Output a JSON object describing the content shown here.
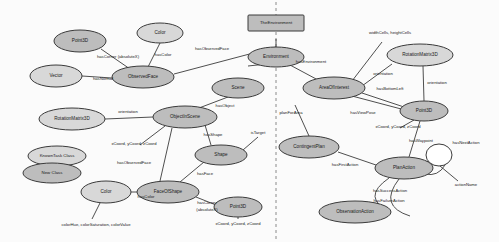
{
  "diagram": {
    "colors": {
      "node_shaded": "#bdbdbd",
      "node_light": "#d8d8d8",
      "node_blank": "#ffffff",
      "stroke": "#3b3b3b",
      "divider": "#8a8a8a",
      "background": "#fbfbfb"
    },
    "instance_nodes": [
      {
        "id": "the-environment",
        "label": "TheEnvironment",
        "shape": "rectangle",
        "x": 276,
        "y": 23,
        "w": 56,
        "h": 16
      }
    ],
    "class_nodes": [
      {
        "id": "point3d-left",
        "label": "Point3D",
        "x": 80,
        "y": 41,
        "rx": 26,
        "ry": 11,
        "fill": "shaded"
      },
      {
        "id": "color-top",
        "label": "Color",
        "x": 160,
        "y": 33,
        "rx": 23,
        "ry": 10,
        "fill": "light"
      },
      {
        "id": "vector",
        "label": "Vector",
        "x": 56,
        "y": 76,
        "rx": 26,
        "ry": 11,
        "fill": "light"
      },
      {
        "id": "observed-face",
        "label": "ObservedFace",
        "x": 143,
        "y": 77,
        "rx": 31,
        "ry": 11,
        "fill": "shaded"
      },
      {
        "id": "environment",
        "label": "Environment",
        "x": 276,
        "y": 57,
        "rx": 28,
        "ry": 10,
        "fill": "shaded"
      },
      {
        "id": "area-of-interest",
        "label": "AreaOfInterest",
        "x": 334,
        "y": 88,
        "rx": 31,
        "ry": 11,
        "fill": "shaded"
      },
      {
        "id": "rotation-matrix-r",
        "label": "RotationMatrix3D",
        "x": 420,
        "y": 55,
        "rx": 33,
        "ry": 11,
        "fill": "light"
      },
      {
        "id": "point3d-right",
        "label": "Point3D",
        "x": 424,
        "y": 111,
        "rx": 24,
        "ry": 10,
        "fill": "shaded"
      },
      {
        "id": "scene",
        "label": "Scene",
        "x": 238,
        "y": 88,
        "rx": 26,
        "ry": 10,
        "fill": "shaded"
      },
      {
        "id": "rotation-matrix-l",
        "label": "RotationMatrix3D",
        "x": 72,
        "y": 119,
        "rx": 33,
        "ry": 11,
        "fill": "light"
      },
      {
        "id": "object-in-scene",
        "label": "ObjectInScene",
        "x": 185,
        "y": 117,
        "rx": 32,
        "ry": 11,
        "fill": "shaded"
      },
      {
        "id": "shape",
        "label": "Shape",
        "x": 221,
        "y": 155,
        "rx": 26,
        "ry": 10,
        "fill": "shaded"
      },
      {
        "id": "face-of-shape",
        "label": "FaceOfShape",
        "x": 168,
        "y": 192,
        "rx": 31,
        "ry": 11,
        "fill": "shaded"
      },
      {
        "id": "color-bottom",
        "label": "Color",
        "x": 106,
        "y": 192,
        "rx": 25,
        "ry": 11,
        "fill": "light"
      },
      {
        "id": "point3d-bottom",
        "label": "Point3D",
        "x": 238,
        "y": 207,
        "rx": 24,
        "ry": 10,
        "fill": "shaded"
      },
      {
        "id": "contingent-plan",
        "label": "ContingentPlan",
        "x": 309,
        "y": 147,
        "rx": 30,
        "ry": 11,
        "fill": "shaded"
      },
      {
        "id": "plan-action",
        "label": "PlanAction",
        "x": 404,
        "y": 168,
        "rx": 29,
        "ry": 11,
        "fill": "shaded"
      },
      {
        "id": "observation-action",
        "label": "ObservationAction",
        "x": 355,
        "y": 212,
        "rx": 36,
        "ry": 11,
        "fill": "shaded"
      },
      {
        "id": "action-name-value",
        "label": "",
        "x": 439,
        "y": 155,
        "rx": 13,
        "ry": 11,
        "fill": "blank"
      }
    ],
    "legend": [
      {
        "id": "legend-known",
        "label": "KnownTask Class",
        "x": 57,
        "y": 156,
        "rx": 29,
        "ry": 10,
        "fill": "light"
      },
      {
        "id": "legend-new",
        "label": "New Class",
        "x": 52,
        "y": 173,
        "rx": 29,
        "ry": 10,
        "fill": "shaded"
      }
    ],
    "edge_labels": [
      {
        "id": "has-corner-left",
        "text": "hasCorner (absoluteX)",
        "x": 118,
        "y": 57
      },
      {
        "id": "has-color-top",
        "text": "hasColor",
        "x": 163,
        "y": 55
      },
      {
        "id": "has-normal",
        "text": "hasNormal",
        "x": 103,
        "y": 79
      },
      {
        "id": "has-observed-face-top",
        "text": "hasObservedFace",
        "x": 212,
        "y": 49
      },
      {
        "id": "has-environment",
        "text": "hasEnvironment",
        "x": 311,
        "y": 62
      },
      {
        "id": "width-height-cells",
        "text": "widthCells, heightCells",
        "x": 390,
        "y": 33
      },
      {
        "id": "orientation-right",
        "text": "orientation",
        "x": 383,
        "y": 74
      },
      {
        "id": "has-bottom-left",
        "text": "hasBottomLeft",
        "x": 390,
        "y": 89
      },
      {
        "id": "orientation-vert",
        "text": "orientation",
        "x": 433,
        "y": 83
      },
      {
        "id": "x-y-z-coord-right",
        "text": "xCoord, yCoord, zCoord",
        "x": 398,
        "y": 127
      },
      {
        "id": "has-view-pose",
        "text": "hasViewPose",
        "x": 365,
        "y": 113
      },
      {
        "id": "has-waypoint",
        "text": "hasWaypoint",
        "x": 421,
        "y": 141
      },
      {
        "id": "has-next-action",
        "text": "hasNextAction",
        "x": 466,
        "y": 143
      },
      {
        "id": "action-name",
        "text": "actionName",
        "x": 463,
        "y": 185
      },
      {
        "id": "plan-for-area",
        "text": "planForArea",
        "x": 283,
        "y": 113
      },
      {
        "id": "has-first-action",
        "text": "hasFirstAction",
        "x": 345,
        "y": 165
      },
      {
        "id": "has-success-action",
        "text": "hasSuccessAction",
        "x": 390,
        "y": 191
      },
      {
        "id": "has-failure-action",
        "text": "hasFailureAction",
        "x": 389,
        "y": 201
      },
      {
        "id": "has-object",
        "text": "hasObject",
        "x": 225,
        "y": 106
      },
      {
        "id": "orientation-left",
        "text": "orientation",
        "x": 128,
        "y": 112
      },
      {
        "id": "x-y-z-coord-left",
        "text": "xCoord, yCoord, zCoord",
        "x": 134,
        "y": 144
      },
      {
        "id": "has-shape",
        "text": "hasShape",
        "x": 213,
        "y": 135
      },
      {
        "id": "is-target",
        "text": "isTarget",
        "x": 256,
        "y": 133
      },
      {
        "id": "has-face",
        "text": "hasFace",
        "x": 205,
        "y": 174
      },
      {
        "id": "has-observed-face-bot",
        "text": "hasObservedFace",
        "x": 134,
        "y": 163
      },
      {
        "id": "has-color-bottom",
        "text": "hasColor",
        "x": 143,
        "y": 196
      },
      {
        "id": "color-attrs",
        "text": "colorHue, colorSaturation, colorValue",
        "x": 96,
        "y": 225
      },
      {
        "id": "has-corner-bottom",
        "text": "hasCorner",
        "x": 205,
        "y": 203
      },
      {
        "id": "absolute-xyz",
        "text": "(absoluteX)",
        "x": 205,
        "y": 210
      },
      {
        "id": "x-y-z-coord-bottom",
        "text": "xCoord, yCoord, zCoord",
        "x": 236,
        "y": 224
      }
    ]
  }
}
